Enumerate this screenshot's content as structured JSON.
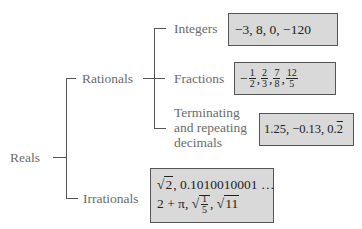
{
  "tree": {
    "root": "Reals",
    "rationals": {
      "label": "Rationals",
      "children": [
        {
          "label": "Integers",
          "examples": "−3, 8, 0, −120"
        },
        {
          "label": "Fractions",
          "examples": [
            "−",
            "1",
            "2",
            ", ",
            "2",
            "3",
            ", ",
            "7",
            "8",
            ", ",
            "12",
            "5"
          ]
        },
        {
          "label_lines": [
            "Terminating",
            "and repeating",
            "decimals"
          ],
          "examples": "1.25, −0.13, 0.",
          "repeat_digit": "2"
        }
      ]
    },
    "irrationals": {
      "label": "Irrationals",
      "examples_line1_root": "2",
      "examples_line1_rest": ", 0.1010010001 …",
      "examples_line2_prefix": "2 + π, ",
      "examples_line2_frac": [
        "1",
        "5"
      ],
      "examples_line2_last": "11"
    }
  },
  "colors": {
    "line": "#555555",
    "label_text": "#6b6b6b",
    "box_fill": "#d9d9d9",
    "box_border": "#555555"
  }
}
